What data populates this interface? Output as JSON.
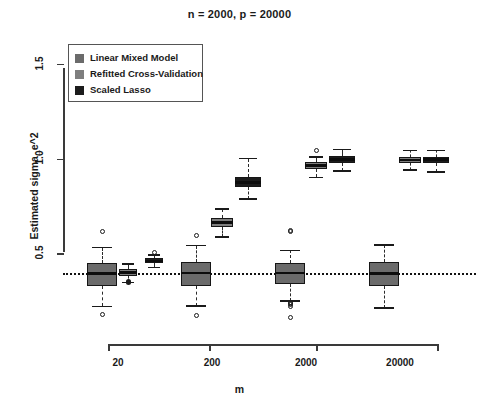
{
  "chart_data": {
    "type": "box",
    "title": "n = 2000, p = 20000",
    "xlabel": "m",
    "ylabel": "Estimated sigma_e^2",
    "categories": [
      "20",
      "200",
      "2000",
      "20000"
    ],
    "ytick_labels": [
      "0.5",
      "1.0",
      "1.5"
    ],
    "ytick_values": [
      0.5,
      1.0,
      1.5
    ],
    "ylim": [
      0.1,
      1.62
    ],
    "grid": false,
    "legend_position": "top-left",
    "reference_line": {
      "value": 0.4,
      "style": "dotted",
      "color": "#111111"
    },
    "series": [
      {
        "name": "Linear Mixed Model",
        "color": "#6b6b6b",
        "boxes": [
          {
            "category": "20",
            "min": 0.225,
            "q1": 0.33,
            "median": 0.398,
            "q3": 0.455,
            "max": 0.535,
            "outliers": [
              0.62,
              0.18
            ]
          },
          {
            "category": "200",
            "min": 0.228,
            "q1": 0.332,
            "median": 0.4,
            "q3": 0.458,
            "max": 0.545,
            "outliers": [
              0.6,
              0.178
            ]
          },
          {
            "category": "2000",
            "min": 0.252,
            "q1": 0.345,
            "median": 0.4,
            "q3": 0.455,
            "max": 0.52,
            "outliers": [
              0.625,
              0.618,
              0.225,
              0.232,
              0.238,
              0.245,
              0.165
            ]
          },
          {
            "category": "20000",
            "min": 0.215,
            "q1": 0.33,
            "median": 0.398,
            "q3": 0.46,
            "max": 0.55,
            "outliers": []
          }
        ]
      },
      {
        "name": "Refitted Cross-Validation",
        "color": "#7e7e7e",
        "boxes": [
          {
            "category": "20",
            "min": 0.35,
            "q1": 0.385,
            "median": 0.405,
            "q3": 0.42,
            "max": 0.448,
            "outliers": [
              0.358,
              0.352
            ]
          },
          {
            "category": "200",
            "min": 0.592,
            "q1": 0.645,
            "median": 0.668,
            "q3": 0.692,
            "max": 0.74,
            "outliers": []
          },
          {
            "category": "2000",
            "min": 0.905,
            "q1": 0.95,
            "median": 0.968,
            "q3": 0.985,
            "max": 1.012,
            "outliers": [
              1.045
            ]
          },
          {
            "category": "20000",
            "min": 0.945,
            "q1": 0.98,
            "median": 0.998,
            "q3": 1.012,
            "max": 1.048,
            "outliers": []
          }
        ]
      },
      {
        "name": "Scaled Lasso",
        "color": "#1c1c1c",
        "boxes": [
          {
            "category": "20",
            "min": 0.43,
            "q1": 0.452,
            "median": 0.465,
            "q3": 0.478,
            "max": 0.495,
            "outliers": [
              0.508
            ]
          },
          {
            "category": "200",
            "min": 0.79,
            "q1": 0.855,
            "median": 0.88,
            "q3": 0.91,
            "max": 1.005,
            "outliers": []
          },
          {
            "category": "2000",
            "min": 0.938,
            "q1": 0.982,
            "median": 1.0,
            "q3": 1.018,
            "max": 1.052,
            "outliers": []
          },
          {
            "category": "20000",
            "min": 0.935,
            "q1": 0.982,
            "median": 1.0,
            "q3": 1.015,
            "max": 1.048,
            "outliers": []
          }
        ]
      }
    ]
  },
  "legend": {
    "items": [
      {
        "label": "Linear Mixed Model",
        "color": "#6b6b6b"
      },
      {
        "label": "Refitted Cross-Validation",
        "color": "#7e7e7e"
      },
      {
        "label": "Scaled Lasso",
        "color": "#1c1c1c"
      }
    ]
  }
}
